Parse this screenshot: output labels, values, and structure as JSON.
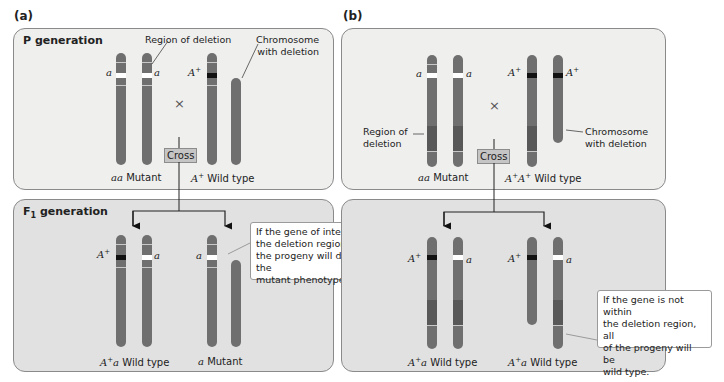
{
  "panels": {
    "a": {
      "label": "(a)",
      "p_generation": {
        "title": "P generation",
        "annotation_region": "Region of deletion",
        "annotation_chromosome": [
          "Chromosome",
          "with deletion"
        ],
        "cross_symbol": "×",
        "cross_label": "Cross",
        "left_parent": {
          "genotype": "aa",
          "phenotype": "Mutant",
          "alleles": [
            "a",
            "a"
          ]
        },
        "right_parent": {
          "genotype": "A+",
          "phenotype": "Wild type",
          "alleles": [
            "A+"
          ]
        }
      },
      "f1_generation": {
        "title": "F",
        "title_sub": "1",
        "title_rest": " generation",
        "left_progeny": {
          "genotype": "A+a",
          "phenotype": "Wild type",
          "alleles": [
            "A+",
            "a"
          ]
        },
        "right_progeny": {
          "genotype": "a",
          "phenotype": "Mutant",
          "alleles": [
            "a"
          ]
        },
        "callout": [
          "If the gene of interest is in",
          "the deletion region, half of",
          "the progeny will display the",
          "mutant phenotype."
        ]
      }
    },
    "b": {
      "label": "(b)",
      "p_generation": {
        "annotation_region": [
          "Region of",
          "deletion"
        ],
        "annotation_chromosome": [
          "Chromosome",
          "with deletion"
        ],
        "cross_symbol": "×",
        "cross_label": "Cross",
        "left_parent": {
          "genotype": "aa",
          "phenotype": "Mutant",
          "alleles": [
            "a",
            "a"
          ]
        },
        "right_parent": {
          "genotype": "A+A+",
          "phenotype": "Wild type",
          "alleles": [
            "A+",
            "A+"
          ]
        }
      },
      "f1_generation": {
        "left_progeny": {
          "genotype": "A+a",
          "phenotype": "Wild type",
          "alleles": [
            "A+",
            "a"
          ]
        },
        "right_progeny": {
          "genotype": "A+a",
          "phenotype": "Wild type",
          "alleles": [
            "A+",
            "a"
          ]
        },
        "callout": [
          "If the gene is not within",
          "the deletion region, all",
          "of the progeny will be",
          "wild type."
        ]
      }
    }
  },
  "colors": {
    "chromosome": "#6f6f6f",
    "deletion_region": "#585858",
    "mutant_allele_band": "#ffffff",
    "wildtype_allele_band": "#111111",
    "p_panel_bg": "#efefee",
    "f1_panel_bg": "#e1e1e1",
    "cross_box": "#c5c5c5"
  },
  "caption_fragment": "7.21 Deletion..."
}
